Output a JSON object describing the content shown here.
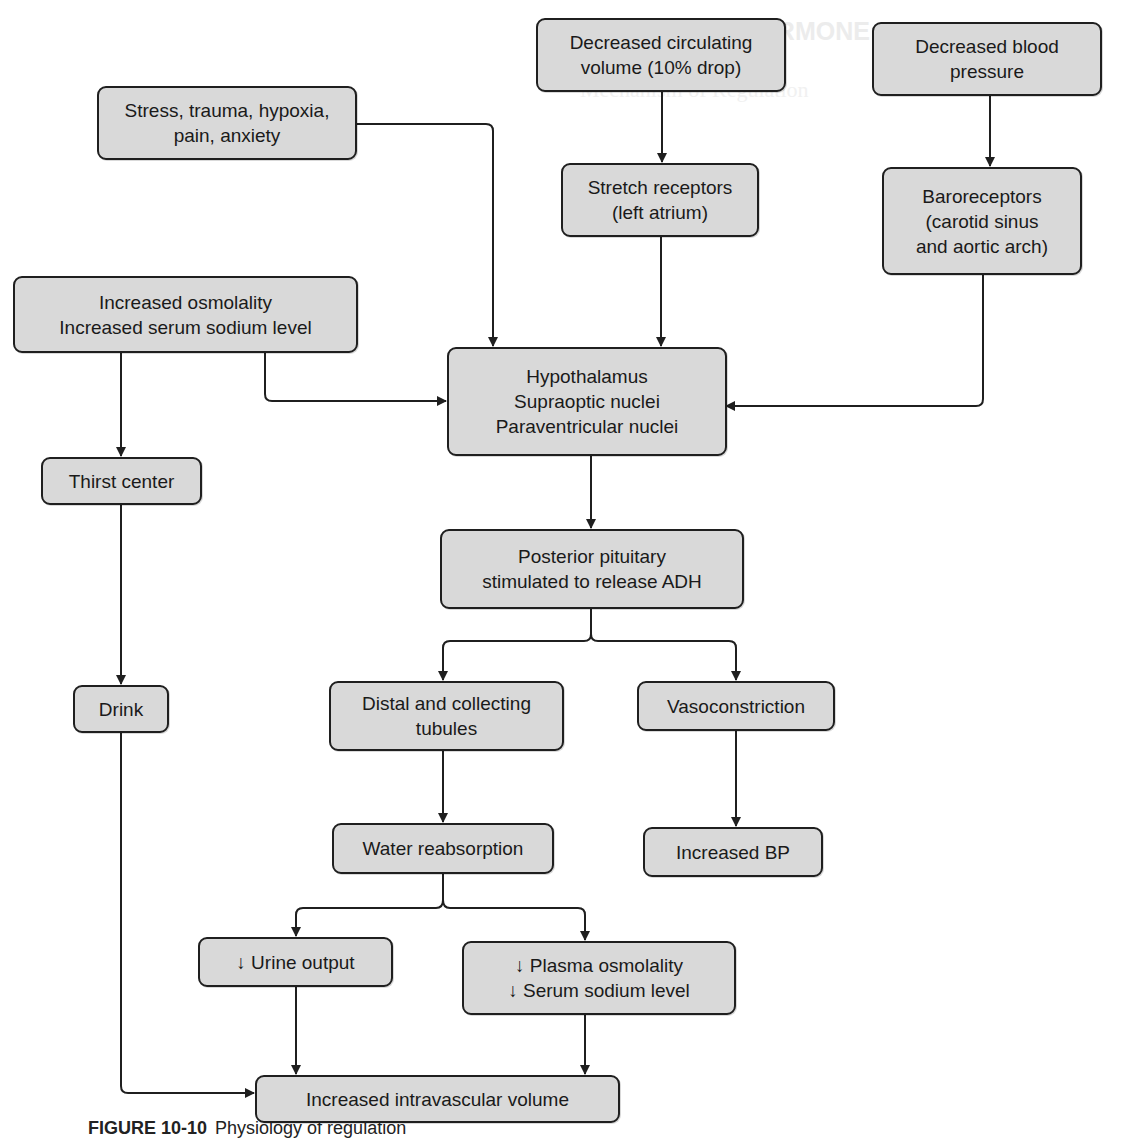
{
  "background_text": {
    "heading": "ANTIDIURETIC HORMONE DISORDERS",
    "subheading": "Mechanism of Regulation"
  },
  "nodes": {
    "decreased_volume": {
      "lines": [
        "Decreased circulating",
        "volume (10% drop)"
      ]
    },
    "decreased_bp": {
      "lines": [
        "Decreased blood",
        "pressure"
      ]
    },
    "stress": {
      "lines": [
        "Stress, trauma, hypoxia,",
        "pain, anxiety"
      ]
    },
    "stretch_receptors": {
      "lines": [
        "Stretch receptors",
        "(left atrium)"
      ]
    },
    "baroreceptors": {
      "lines": [
        "Baroreceptors",
        "(carotid sinus",
        "and aortic arch)"
      ]
    },
    "osmolality": {
      "lines": [
        "Increased osmolality",
        "Increased serum sodium level"
      ]
    },
    "hypothalamus": {
      "lines": [
        "Hypothalamus",
        "Supraoptic nuclei",
        "Paraventricular nuclei"
      ]
    },
    "thirst_center": {
      "lines": [
        "Thirst center"
      ]
    },
    "posterior_pituitary": {
      "lines": [
        "Posterior pituitary",
        "stimulated to release ADH"
      ]
    },
    "drink": {
      "lines": [
        "Drink"
      ]
    },
    "distal_tubules": {
      "lines": [
        "Distal and collecting",
        "tubules"
      ]
    },
    "vasoconstriction": {
      "lines": [
        "Vasoconstriction"
      ]
    },
    "water_reabsorption": {
      "lines": [
        "Water reabsorption"
      ]
    },
    "increased_bp": {
      "lines": [
        "Increased BP"
      ]
    },
    "urine_output": {
      "lines": [
        "↓ Urine output"
      ]
    },
    "plasma_osmolality": {
      "lines": [
        "↓ Plasma osmolality",
        "↓ Serum sodium level"
      ]
    },
    "intravascular_volume": {
      "lines": [
        "Increased intravascular volume"
      ]
    }
  },
  "edges": [
    {
      "from": "decreased_volume",
      "to": "stretch_receptors"
    },
    {
      "from": "decreased_bp",
      "to": "baroreceptors"
    },
    {
      "from": "stress",
      "to": "hypothalamus"
    },
    {
      "from": "stretch_receptors",
      "to": "hypothalamus"
    },
    {
      "from": "baroreceptors",
      "to": "hypothalamus"
    },
    {
      "from": "osmolality",
      "to": "hypothalamus"
    },
    {
      "from": "osmolality",
      "to": "thirst_center"
    },
    {
      "from": "hypothalamus",
      "to": "posterior_pituitary"
    },
    {
      "from": "thirst_center",
      "to": "drink"
    },
    {
      "from": "posterior_pituitary",
      "to": "distal_tubules"
    },
    {
      "from": "posterior_pituitary",
      "to": "vasoconstriction"
    },
    {
      "from": "distal_tubules",
      "to": "water_reabsorption"
    },
    {
      "from": "vasoconstriction",
      "to": "increased_bp"
    },
    {
      "from": "water_reabsorption",
      "to": "urine_output"
    },
    {
      "from": "water_reabsorption",
      "to": "plasma_osmolality"
    },
    {
      "from": "urine_output",
      "to": "intravascular_volume"
    },
    {
      "from": "plasma_osmolality",
      "to": "intravascular_volume"
    },
    {
      "from": "drink",
      "to": "intravascular_volume"
    }
  ],
  "caption": {
    "label": "FIGURE 10-10",
    "text": "Physiology of regulation"
  },
  "colors": {
    "node_fill": "#d9d9d9",
    "node_border": "#1f1f1f",
    "line": "#1f1f1f",
    "background": "#ffffff"
  }
}
